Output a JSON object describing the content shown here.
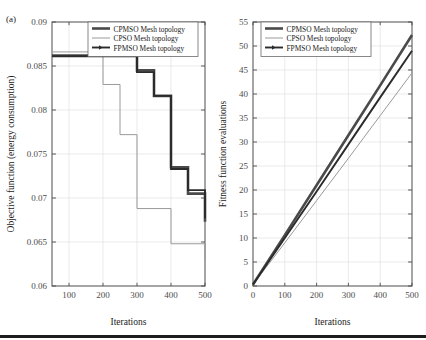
{
  "figure": {
    "panel_tag": "(a)",
    "background": "#ffffff",
    "foreground": "#1a1a1a"
  },
  "colors": {
    "cpmso": "#4a4a4a",
    "cpso": "#9a9a9a",
    "fpmso": "#2b2b2b",
    "axis": "#4d4d4d",
    "grid": "#dcdcdc"
  },
  "legend": {
    "items": [
      {
        "label": "CPMSO Mesh topology",
        "key": "cpmso",
        "width": 2.6,
        "color": "#4a4a4a"
      },
      {
        "label": "CPSO Mesh topology",
        "key": "cpso",
        "width": 1.0,
        "color": "#9a9a9a"
      },
      {
        "label": "FPMSO Mesh topology",
        "key": "fpmso",
        "width": 1.9,
        "color": "#2b2b2b"
      }
    ]
  },
  "chart_data": [
    {
      "id": "objective-function-chart",
      "type": "line",
      "title": "",
      "xlabel": "Iterations",
      "ylabel": "Objective function (energy consumption)",
      "xlim": [
        50,
        500
      ],
      "ylim": [
        0.06,
        0.09
      ],
      "xticks": [
        100,
        200,
        300,
        400,
        500
      ],
      "yticks": [
        0.06,
        0.065,
        0.07,
        0.075,
        0.08,
        0.085,
        0.09
      ],
      "ytick_labels": [
        "0.06",
        "0.065",
        "0.07",
        "0.075",
        "0.08",
        "0.085",
        "0.09"
      ],
      "xtick_labels": [
        "100",
        "200",
        "300",
        "400",
        "500"
      ],
      "grid": true,
      "legend_position": "top-center",
      "step": "post",
      "series": [
        {
          "name": "CPMSO Mesh topology",
          "color": "#4a4a4a",
          "width": 2.6,
          "x": [
            50,
            250,
            300,
            350,
            400,
            450,
            500
          ],
          "y": [
            0.0862,
            0.0862,
            0.0845,
            0.0816,
            0.0735,
            0.0705,
            0.0673
          ]
        },
        {
          "name": "CPSO Mesh topology",
          "color": "#9a9a9a",
          "width": 1.0,
          "x": [
            50,
            150,
            200,
            250,
            300,
            400,
            500
          ],
          "y": [
            0.0866,
            0.0866,
            0.0829,
            0.0772,
            0.0688,
            0.0648,
            0.0629
          ]
        },
        {
          "name": "FPMSO Mesh topology",
          "color": "#2b2b2b",
          "width": 1.9,
          "x": [
            50,
            250,
            300,
            350,
            400,
            450,
            500
          ],
          "y": [
            0.0861,
            0.0861,
            0.0843,
            0.0816,
            0.0733,
            0.0709,
            0.0677
          ]
        }
      ]
    },
    {
      "id": "fitness-evaluations-chart",
      "type": "line",
      "title": "",
      "xlabel": "Iterations",
      "ylabel": "Fitness function evaluations",
      "xlim": [
        0,
        500
      ],
      "ylim": [
        0,
        55
      ],
      "xticks": [
        0,
        100,
        200,
        300,
        400,
        500
      ],
      "yticks": [
        0,
        5,
        10,
        15,
        20,
        25,
        30,
        35,
        40,
        45,
        50,
        55
      ],
      "ytick_labels": [
        "0",
        "5",
        "10",
        "15",
        "20",
        "25",
        "30",
        "35",
        "40",
        "45",
        "50",
        "55"
      ],
      "xtick_labels": [
        "0",
        "100",
        "200",
        "300",
        "400",
        "500"
      ],
      "grid": true,
      "legend_position": "top-left",
      "step": "linear",
      "series": [
        {
          "name": "CPMSO Mesh topology",
          "color": "#4a4a4a",
          "width": 2.6,
          "x": [
            0,
            100,
            200,
            300,
            400,
            500
          ],
          "y": [
            0.3,
            10.6,
            21.0,
            31.4,
            41.8,
            52.3
          ]
        },
        {
          "name": "CPSO Mesh topology",
          "color": "#9a9a9a",
          "width": 1.0,
          "x": [
            0,
            100,
            200,
            300,
            400,
            500
          ],
          "y": [
            0.3,
            9.0,
            17.8,
            26.6,
            35.5,
            44.4
          ]
        },
        {
          "name": "FPMSO Mesh topology",
          "color": "#2b2b2b",
          "width": 1.9,
          "x": [
            0,
            100,
            200,
            300,
            400,
            500
          ],
          "y": [
            0.3,
            10.0,
            19.7,
            29.5,
            39.3,
            49.0
          ]
        }
      ]
    }
  ]
}
